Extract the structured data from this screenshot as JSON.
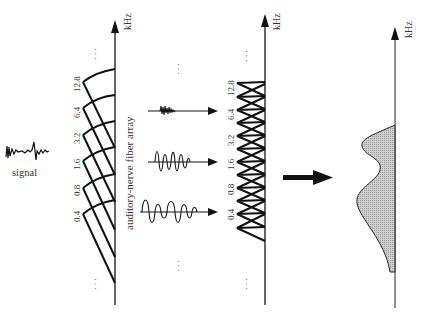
{
  "labels": {
    "signal": "signal",
    "fiber_array": "auditory-nerve fiber array",
    "axis_unit_1": "kHz",
    "axis_unit_2": "kHz",
    "axis_unit_3": "kHz",
    "ellipsis": "· · ·"
  },
  "fan_ticks": [
    "0.4",
    "0.8",
    "1.6",
    "3.2",
    "6.4",
    "12.8"
  ],
  "filter_ticks": [
    "0.4",
    "0.8",
    "1.6",
    "3.2",
    "6.4",
    "12.8"
  ],
  "components": [
    {
      "name": "high-frequency-component",
      "target": "6.4"
    },
    {
      "name": "mid-frequency-component",
      "target": "1.6"
    },
    {
      "name": "low-frequency-component",
      "target": "0.4"
    }
  ],
  "colors": {
    "ink": "#111111",
    "fill": "#c8c8c8",
    "label": "#333333"
  }
}
